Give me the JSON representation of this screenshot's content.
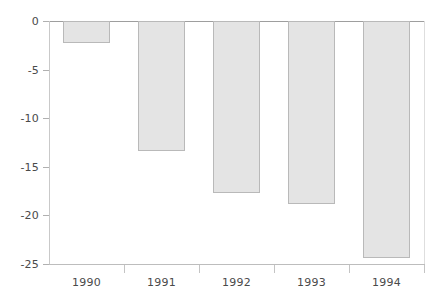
{
  "chart_data": {
    "type": "bar",
    "title": "",
    "subtitle": "",
    "xlabel": "",
    "ylabel": "",
    "categories": [
      "1990",
      "1991",
      "1992",
      "1993",
      "1994"
    ],
    "values": [
      -2.3,
      -13.4,
      -17.7,
      -18.8,
      -24.4
    ],
    "series": [
      {
        "name": "",
        "values": [
          -2.3,
          -13.4,
          -17.7,
          -18.8,
          -24.4
        ]
      }
    ],
    "ylim": [
      -25,
      0
    ],
    "yticks": [
      0,
      -5,
      -10,
      -15,
      -20,
      -25
    ],
    "ytick_labels": [
      "0",
      "-5",
      "-10",
      "-15",
      "-20",
      "-25"
    ],
    "xtick_labels": [
      "1990",
      "1991",
      "1992",
      "1993",
      "1994"
    ],
    "grid": false,
    "legend": null,
    "legend_position": "none",
    "orientation": "vertical",
    "bar_fill_color": "#e4e4e4",
    "bar_border_color": "#b9b9b9",
    "axis_color": "#bdbdbd",
    "zero_line_color": "#9e9e9e",
    "text_color": "#4a4a4a",
    "background_color": "#ffffff",
    "annotations": []
  }
}
